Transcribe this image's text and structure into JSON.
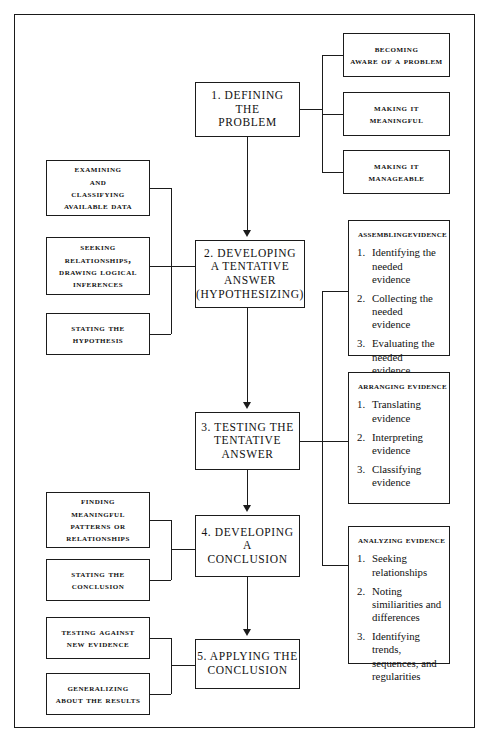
{
  "diagram": {
    "ink_color": "#1b1b1b",
    "paper_color": "#ffffff"
  },
  "spine": {
    "step1": {
      "l1": "1.  Defining",
      "l2": "the",
      "l3": "Problem"
    },
    "step2": {
      "l1": "2.  Developing",
      "l2": "a  Tentative",
      "l3": "Answer",
      "l4": "(Hypothesizing)"
    },
    "step3": {
      "l1": "3.  Testing  the",
      "l2": "Tentative",
      "l3": "Answer"
    },
    "step4": {
      "l1": "4.  Developing",
      "l2": "a",
      "l3": "Conclusion"
    },
    "step5": {
      "l1": "5.  Applying  the",
      "l2": "Conclusion"
    }
  },
  "step1_branches": {
    "b1": {
      "l1": "Becoming",
      "l2": "Aware of a Problem"
    },
    "b2": {
      "l1": "Making It",
      "l2": "Meaningful"
    },
    "b3": {
      "l1": "Making It",
      "l2": "Manageable"
    }
  },
  "step2_inputs": {
    "i1": {
      "l1": "Examining",
      "l2": "and",
      "l3": "Classifying",
      "l4": "Available Data"
    },
    "i2": {
      "l1": "Seeking",
      "l2": "Relationships,",
      "l3": "Drawing Logical",
      "l4": "Inferences"
    },
    "i3": {
      "l1": "Stating the",
      "l2": "Hypothesis"
    }
  },
  "step4_inputs": {
    "i1": {
      "l1": "Finding",
      "l2": "Meaningful",
      "l3": "Patterns or",
      "l4": "Relationships"
    },
    "i2": {
      "l1": "Stating the",
      "l2": "Conclusion"
    }
  },
  "step5_inputs": {
    "i1": {
      "l1": "Testing against",
      "l2": "New Evidence"
    },
    "i2": {
      "l1": "Generalizing",
      "l2": "about the Results"
    }
  },
  "evidence_panels": [
    {
      "title": "AssemblingEvidence",
      "items": [
        {
          "num": "1.",
          "text": "Identifying the needed evidence"
        },
        {
          "num": "2.",
          "text": "Collecting the needed evidence"
        },
        {
          "num": "3.",
          "text": "Evaluating the needed evidence"
        }
      ]
    },
    {
      "title": "Arranging  Evidence",
      "items": [
        {
          "num": "1.",
          "text": "Translating evidence"
        },
        {
          "num": "2.",
          "text": "Interpreting evidence"
        },
        {
          "num": "3.",
          "text": "Classifying evidence"
        }
      ]
    },
    {
      "title": "Analyzing  Evidence",
      "items": [
        {
          "num": "1.",
          "text": "Seeking relationships"
        },
        {
          "num": "2.",
          "text": "Noting similiarities and differences"
        },
        {
          "num": "3.",
          "text": "Identifying trends, sequences, and regularities"
        }
      ]
    }
  ]
}
